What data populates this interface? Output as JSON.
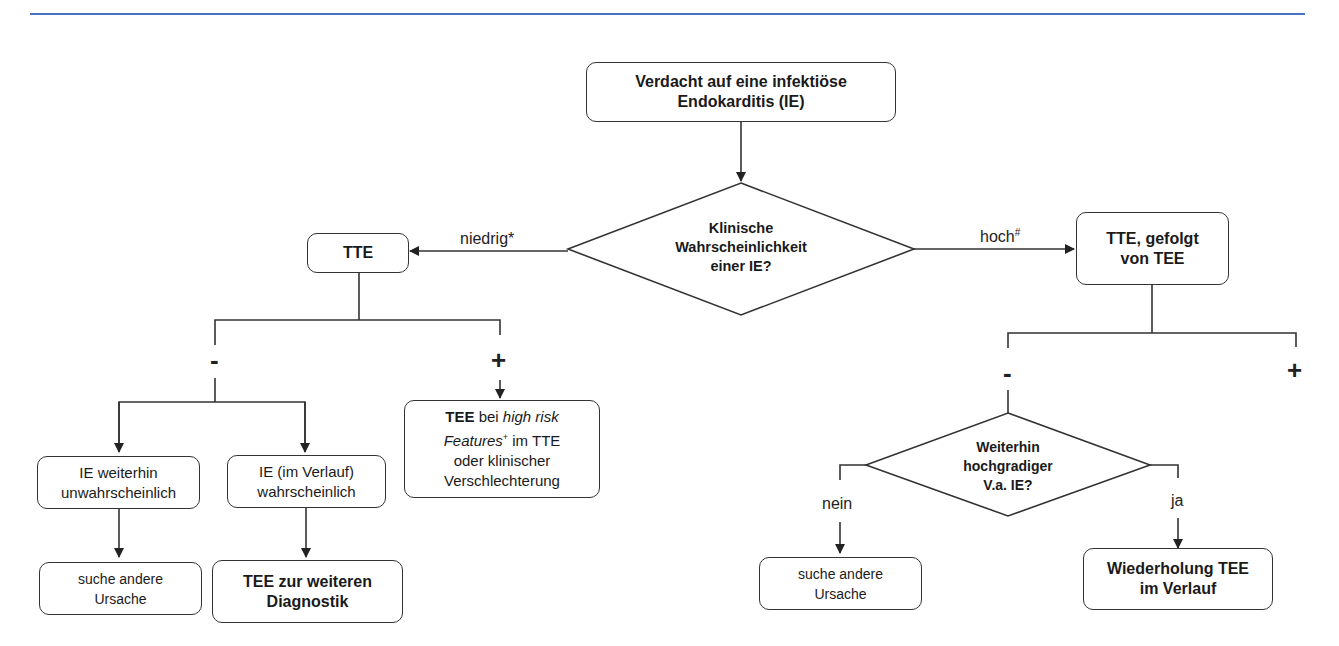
{
  "diagram": {
    "type": "flowchart",
    "accent_line_color": "#4a72c4",
    "nodes": {
      "start": {
        "line1": "Verdacht auf eine infektiöse",
        "line2": "Endokarditis (IE)"
      },
      "decision1": {
        "line1": "Klinische",
        "line2": "Wahrscheinlichkeit",
        "line3": "einer IE?"
      },
      "tte": {
        "label": "TTE"
      },
      "tte_tee": {
        "line1": "TTE, gefolgt",
        "line2": "von TEE"
      },
      "tee_high_risk": {
        "bold": "TEE",
        "t1": " bei ",
        "italic1": "high risk",
        "italic2": "Features",
        "sup": "+",
        "t2": " im TTE",
        "line3": "oder klinischer",
        "line4": "Verschlechterung"
      },
      "ie_unlikely": {
        "line1": "IE weiterhin",
        "line2": "unwahrscheinlich"
      },
      "ie_likely": {
        "line1": "IE (im Verlauf)",
        "line2": "wahrscheinlich"
      },
      "other_cause_left": {
        "line1": "suche andere",
        "line2": "Ursache"
      },
      "tee_further": {
        "line1": "TEE zur weiteren",
        "line2": "Diagnostik"
      },
      "decision2": {
        "line1": "Weiterhin",
        "line2": "hochgradiger",
        "line3": "V.a. IE?"
      },
      "other_cause_right": {
        "line1": "suche andere",
        "line2": "Ursache"
      },
      "repeat_tee": {
        "line1": "Wiederholung TEE",
        "line2": "im Verlauf"
      }
    },
    "edge_labels": {
      "low": "niedrig*",
      "high": "hoch",
      "high_sup": "#",
      "minus": "-",
      "plus": "+",
      "no": "nein",
      "yes": "ja"
    }
  }
}
